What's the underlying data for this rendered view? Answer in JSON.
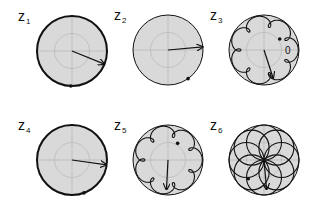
{
  "figure": {
    "zero_label": "0",
    "panels": [
      {
        "id": "z1",
        "label": "z",
        "subscript": "1",
        "loops": 0,
        "petals": 0,
        "arrow_angle_deg": -22,
        "endpoint_angle_deg": -92,
        "outline": "bold"
      },
      {
        "id": "z2",
        "label": "z",
        "subscript": "2",
        "loops": 0,
        "petals": 0,
        "arrow_angle_deg": 5,
        "endpoint_angle_deg": -55,
        "outline": "thin"
      },
      {
        "id": "z3",
        "label": "z",
        "subscript": "3",
        "loops": 7,
        "petals": 0,
        "arrow_angle_deg": -72,
        "endpoint_angle_deg": 35,
        "outline": "thin"
      },
      {
        "id": "z4",
        "label": "z",
        "subscript": "4",
        "loops": 0,
        "petals": 0,
        "arrow_angle_deg": -8,
        "endpoint_angle_deg": -70,
        "outline": "bold"
      },
      {
        "id": "z5",
        "label": "z",
        "subscript": "5",
        "loops": 7,
        "petals": 0,
        "arrow_angle_deg": -93,
        "endpoint_angle_deg": 60,
        "outline": "thin"
      },
      {
        "id": "z6",
        "label": "z",
        "subscript": "6",
        "loops": 0,
        "petals": 8,
        "arrow_angle_deg": -85,
        "endpoint_angle_deg": -130,
        "outline": "thin"
      }
    ]
  }
}
